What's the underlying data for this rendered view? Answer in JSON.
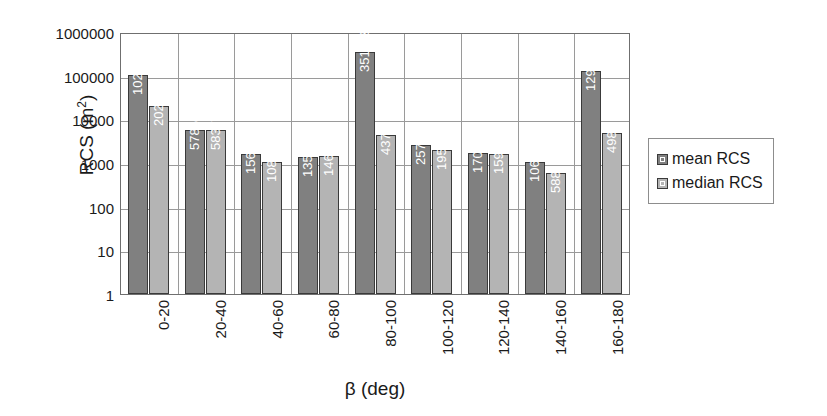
{
  "chart_data": {
    "type": "bar",
    "title": "",
    "xlabel": "β (deg)",
    "ylabel": "RCS (m²)",
    "ylabel_base": "RCS (m",
    "ylabel_exp": "2",
    "ylabel_tail": ")",
    "scale": "log",
    "ylim": [
      1,
      1000000
    ],
    "ytick_labels": [
      "1000000",
      "100000",
      "10000",
      "1000",
      "100",
      "10",
      "1"
    ],
    "ytick_values": [
      1000000,
      100000,
      10000,
      1000,
      100,
      10,
      1
    ],
    "grid": "horizontal-and-vertical",
    "legend_position": "right",
    "categories": [
      "0-20",
      "20-40",
      "40-60",
      "60-80",
      "80-100",
      "100-120",
      "120-140",
      "140-160",
      "160-180"
    ],
    "series": [
      {
        "name": "mean RCS",
        "color": "#808080",
        "values": [
          102913,
          5785,
          1567,
          1359,
          351698,
          2570,
          1700,
          1064,
          129408
        ],
        "labels": [
          "102913",
          "5785",
          "1567",
          "1359",
          "351698",
          "2570",
          "1700",
          "1064",
          "129408"
        ]
      },
      {
        "name": "median RCS",
        "color": "#b4b4b4",
        "values": [
          20206,
          5837,
          1082,
          1462,
          4370,
          1958,
          1593,
          588,
          4980
        ],
        "labels": [
          "20206",
          "5837",
          "1082",
          "1462",
          "4370",
          "1958",
          "1593",
          "588",
          "4980"
        ]
      }
    ]
  },
  "legend": {
    "items": [
      {
        "label": "mean RCS",
        "swatch": "dark-gray-swatch-icon"
      },
      {
        "label": "median RCS",
        "swatch": "light-gray-swatch-icon"
      }
    ]
  }
}
